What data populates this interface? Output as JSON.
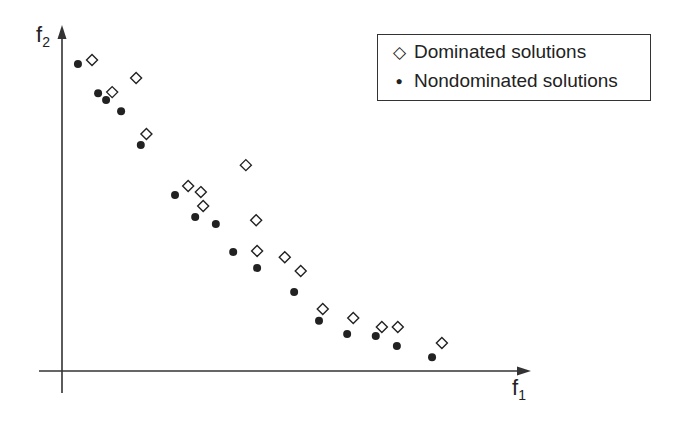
{
  "chart_data": {
    "type": "scatter",
    "title": "",
    "xlabel": "f1",
    "ylabel": "f2",
    "xlim": [
      0,
      100
    ],
    "ylim": [
      0,
      100
    ],
    "grid": false,
    "ticks": false,
    "legend_position": "upper right",
    "series": [
      {
        "name": "Dominated solutions",
        "marker": "open-diamond",
        "points": [
          [
            6.4,
            89.9
          ],
          [
            10.7,
            80.6
          ],
          [
            15.8,
            84.7
          ],
          [
            18.0,
            68.5
          ],
          [
            26.9,
            53.5
          ],
          [
            29.6,
            51.7
          ],
          [
            30.1,
            47.7
          ],
          [
            39.2,
            59.5
          ],
          [
            41.4,
            43.6
          ],
          [
            41.6,
            34.7
          ],
          [
            47.5,
            32.9
          ],
          [
            50.9,
            28.9
          ],
          [
            55.6,
            17.9
          ],
          [
            62.1,
            15.3
          ],
          [
            68.2,
            12.7
          ],
          [
            71.6,
            12.7
          ],
          [
            81.0,
            8.1
          ]
        ]
      },
      {
        "name": "Nondominated solutions",
        "marker": "filled-circle",
        "points": [
          [
            3.4,
            88.7
          ],
          [
            7.7,
            80.3
          ],
          [
            9.4,
            78.3
          ],
          [
            12.6,
            75.1
          ],
          [
            16.8,
            65.3
          ],
          [
            24.1,
            50.9
          ],
          [
            28.4,
            44.5
          ],
          [
            32.8,
            42.5
          ],
          [
            36.5,
            34.4
          ],
          [
            41.6,
            29.8
          ],
          [
            49.5,
            22.8
          ],
          [
            54.8,
            14.5
          ],
          [
            60.8,
            10.7
          ],
          [
            66.9,
            10.1
          ],
          [
            71.4,
            7.2
          ],
          [
            78.9,
            4.0
          ]
        ]
      }
    ]
  },
  "legend": {
    "dominated_label": "Dominated solutions",
    "dominated_symbol": "◇",
    "nondominated_label": "Nondominated solutions",
    "nondominated_symbol": "●"
  },
  "axes": {
    "x_label_main": "f",
    "x_label_sub": "1",
    "y_label_main": "f",
    "y_label_sub": "2"
  },
  "colors": {
    "ink": "#222222",
    "axis": "#333333",
    "background": "#ffffff"
  }
}
